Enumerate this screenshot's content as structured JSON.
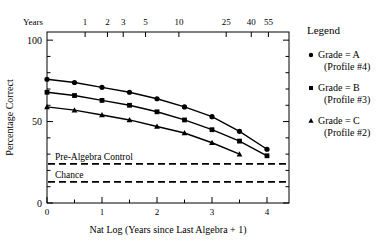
{
  "chart_data": {
    "type": "line",
    "title": "",
    "xlabel": "Nat Log (Years since Last Algebra  + 1)",
    "ylabel": "Percentage Correct",
    "xlim": [
      0,
      4.4
    ],
    "ylim": [
      0,
      105
    ],
    "grid": false,
    "x_ticks": [
      "0",
      "1",
      "2",
      "3",
      "4"
    ],
    "x_tick_values": [
      0,
      1,
      2,
      3,
      4
    ],
    "x_minor_ticks": [
      0.5,
      1.5,
      2.5,
      3.5
    ],
    "y_ticks": [
      "0",
      "50",
      "100"
    ],
    "y_tick_values": [
      0,
      50,
      100
    ],
    "y_minor_ticks": [
      10,
      20,
      30,
      40,
      60,
      70,
      80,
      90
    ],
    "secondary_axis": {
      "label": "Years",
      "position": "top",
      "ticks": [
        "1",
        "2",
        "3",
        "5",
        "10",
        "25",
        "40",
        "55"
      ],
      "tick_values": [
        0.693,
        1.099,
        1.386,
        1.792,
        2.398,
        3.258,
        3.714,
        4.025
      ]
    },
    "x": [
      0,
      0.5,
      1.0,
      1.5,
      2.0,
      2.5,
      3.0,
      3.5,
      4.0
    ],
    "series": [
      {
        "name": "Grade = A",
        "profile": "(Profile #4)",
        "marker": "circle",
        "values": [
          76,
          74,
          71,
          68,
          64,
          59,
          53,
          44,
          33
        ]
      },
      {
        "name": "Grade = B",
        "profile": "(Profile #3)",
        "marker": "square",
        "values": [
          68,
          66,
          63,
          60,
          56,
          51,
          45,
          38,
          29
        ]
      },
      {
        "name": "Grade = C",
        "profile": "(Profile #2)",
        "marker": "triangle",
        "values": [
          59,
          57,
          54,
          51,
          47,
          43,
          37,
          30,
          null
        ]
      }
    ],
    "reference_lines": [
      {
        "label": "Pre-Algebra Control",
        "value": 24,
        "style": "dashed"
      },
      {
        "label": "Chance",
        "value": 13,
        "style": "dashed"
      }
    ],
    "legend": {
      "title": "Legend",
      "position": "right",
      "entries": [
        {
          "label": "Grade = A",
          "sublabel": "(Profile #4)",
          "marker": "circle"
        },
        {
          "label": "Grade = B",
          "sublabel": "(Profile #3)",
          "marker": "square"
        },
        {
          "label": "Grade = C",
          "sublabel": "(Profile #2)",
          "marker": "triangle"
        }
      ]
    },
    "colors": {
      "line": "#000000",
      "marker": "#000000",
      "axis": "#000000",
      "reference": "#000000"
    }
  }
}
